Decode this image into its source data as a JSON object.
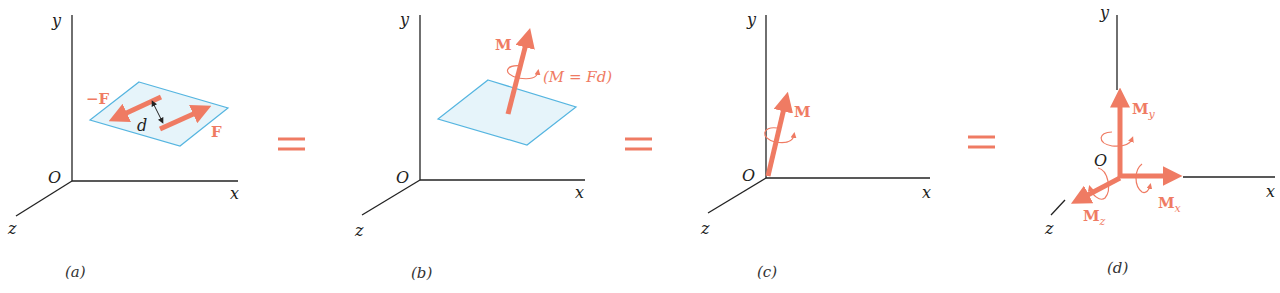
{
  "colors": {
    "accent": "#ef7b63",
    "plane_fill": "#e6f4fa",
    "plane_stroke": "#55b5e0",
    "axis": "#222222"
  },
  "panels": [
    {
      "id": "a",
      "caption": "(a)",
      "axes": {
        "x": "x",
        "y": "y",
        "z": "z",
        "origin": "O"
      },
      "labels": {
        "neg_force": "−F",
        "force": "F",
        "distance": "d"
      }
    },
    {
      "id": "b",
      "caption": "(b)",
      "axes": {
        "x": "x",
        "y": "y",
        "z": "z",
        "origin": "O"
      },
      "labels": {
        "moment": "M",
        "formula": "(M = Fd)"
      }
    },
    {
      "id": "c",
      "caption": "(c)",
      "axes": {
        "x": "x",
        "y": "y",
        "z": "z",
        "origin": "O"
      },
      "labels": {
        "moment": "M"
      }
    },
    {
      "id": "d",
      "caption": "(d)",
      "axes": {
        "x": "x",
        "y": "y",
        "z": "z",
        "origin": "O"
      },
      "labels": {
        "mx": "M",
        "mx_sub": "x",
        "my": "M",
        "my_sub": "y",
        "mz": "M",
        "mz_sub": "z"
      }
    }
  ],
  "equals_signs": 3
}
